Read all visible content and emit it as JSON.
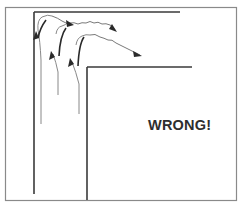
{
  "figure": {
    "caption_label": "WRONG!",
    "colors": {
      "frame": "#7a7a7a",
      "walls": "#3a3a3a",
      "flow": "#555555",
      "arrow": "#2a2a2a",
      "text": "#2e2e2e"
    },
    "elements": {
      "outer_wall": "L-shaped outer boundary (vertical + top horizontal)",
      "inner_wall": "L-shaped inner boundary (vertical + top horizontal)",
      "flow_lines": 3,
      "curved_arrows": 3,
      "wavy_right_arrows": 2
    }
  }
}
